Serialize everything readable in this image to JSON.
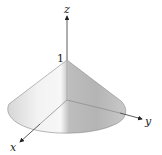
{
  "figure": {
    "surface": "cone",
    "apex_height": 1,
    "labels": {
      "x_axis": "x",
      "y_axis": "y",
      "z_axis": "z",
      "apex_value": "1"
    },
    "colors": {
      "axis": "#333333",
      "surface_light": "#f4f4f4",
      "surface_mid": "#c8c8c8",
      "surface_dark": "#a9a9a9",
      "edge": "#8a8a8a"
    }
  }
}
